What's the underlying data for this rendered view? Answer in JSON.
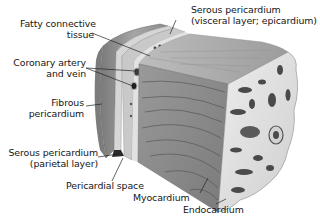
{
  "diagram": {
    "title": "",
    "colors": {
      "background": "#ffffff",
      "text": "#151515",
      "leader_line": "#222222",
      "myocardium": "#8a8a8a",
      "fibrous_pericardium": "#9a9a9a",
      "serous_layers": "#d8d8d8",
      "endocardium": "#e6e6e6"
    },
    "labels": [
      {
        "id": "fatty-connective-tissue",
        "lines": [
          "Fatty connective",
          "tissue"
        ]
      },
      {
        "id": "coronary-artery-and-vein",
        "lines": [
          "Coronary artery",
          "and vein"
        ]
      },
      {
        "id": "fibrous-pericardium",
        "lines": [
          "Fibrous",
          "pericardium"
        ]
      },
      {
        "id": "serous-pericardium-parietal",
        "lines": [
          "Serous pericardium",
          "(parietal layer)"
        ]
      },
      {
        "id": "pericardial-space",
        "lines": [
          "Pericardial space"
        ]
      },
      {
        "id": "myocardium",
        "lines": [
          "Myocardium"
        ]
      },
      {
        "id": "endocardium",
        "lines": [
          "Endocardium"
        ]
      },
      {
        "id": "serous-pericardium-visceral",
        "lines": [
          "Serous pericardium",
          "(visceral layer; epicardium)"
        ]
      }
    ]
  }
}
